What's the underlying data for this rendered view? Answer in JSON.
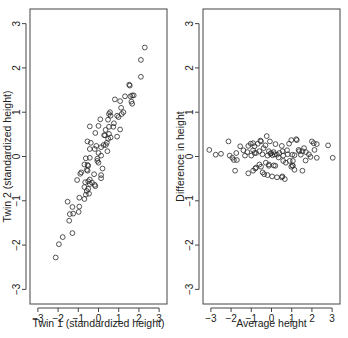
{
  "chart_data": [
    {
      "type": "scatter",
      "title": "",
      "xlabel": "Twin 1 (standardized height)",
      "ylabel": "Twin 2 (standardized height)",
      "xlim": [
        -3,
        3
      ],
      "ylim": [
        -3,
        3
      ],
      "xticks": [
        -3,
        -2,
        -1,
        0,
        1,
        2,
        3
      ],
      "yticks": [
        -3,
        -2,
        -1,
        0,
        1,
        2,
        3
      ],
      "grid": false,
      "legend": null,
      "marker": "open-circle",
      "points": [
        [
          2.29,
          2.46
        ],
        [
          2.1,
          2.18
        ],
        [
          2.1,
          1.8
        ],
        [
          1.52,
          1.62
        ],
        [
          1.55,
          1.6
        ],
        [
          1.31,
          1.36
        ],
        [
          1.74,
          1.38
        ],
        [
          1.58,
          1.36
        ],
        [
          1.67,
          1.38
        ],
        [
          1.07,
          1.25
        ],
        [
          1.63,
          1.24
        ],
        [
          1.67,
          1.19
        ],
        [
          0.81,
          1.29
        ],
        [
          1.12,
          1.1
        ],
        [
          1.23,
          1.0
        ],
        [
          1.15,
          0.96
        ],
        [
          0.57,
          1.0
        ],
        [
          0.6,
          0.92
        ],
        [
          0.92,
          0.92
        ],
        [
          0.99,
          0.89
        ],
        [
          0.52,
          0.96
        ],
        [
          0.09,
          0.84
        ],
        [
          0.47,
          0.83
        ],
        [
          0.76,
          0.75
        ],
        [
          0.0,
          0.69
        ],
        [
          0.52,
          0.67
        ],
        [
          0.73,
          0.67
        ],
        [
          0.35,
          0.6
        ],
        [
          1.07,
          0.61
        ],
        [
          0.28,
          0.48
        ],
        [
          0.92,
          0.45
        ],
        [
          -0.43,
          0.68
        ],
        [
          -0.16,
          0.53
        ],
        [
          0.32,
          0.48
        ],
        [
          0.52,
          0.51
        ],
        [
          0.6,
          0.43
        ],
        [
          0.48,
          0.4
        ],
        [
          -0.38,
          0.31
        ],
        [
          -0.55,
          0.34
        ],
        [
          0.41,
          0.31
        ],
        [
          0.36,
          0.26
        ],
        [
          0.25,
          0.26
        ],
        [
          -0.11,
          0.24
        ],
        [
          0.13,
          0.21
        ],
        [
          0.44,
          0.12
        ],
        [
          -0.19,
          0.17
        ],
        [
          -0.43,
          0.17
        ],
        [
          0.0,
          0.08
        ],
        [
          0.13,
          0.02
        ],
        [
          -0.43,
          -0.03
        ],
        [
          -0.63,
          -0.04
        ],
        [
          -0.06,
          -0.05
        ],
        [
          -0.06,
          -0.1
        ],
        [
          0.0,
          -0.14
        ],
        [
          -0.7,
          -0.18
        ],
        [
          -0.54,
          -0.19
        ],
        [
          -0.51,
          -0.21
        ],
        [
          0.2,
          -0.27
        ],
        [
          -0.58,
          -0.3
        ],
        [
          -0.54,
          -0.32
        ],
        [
          -0.85,
          -0.36
        ],
        [
          -0.9,
          -0.39
        ],
        [
          -0.22,
          -0.4
        ],
        [
          0.13,
          -0.42
        ],
        [
          -0.43,
          -0.52
        ],
        [
          0.13,
          -0.49
        ],
        [
          -0.32,
          -0.59
        ],
        [
          -0.16,
          -0.67
        ],
        [
          -1.06,
          -0.53
        ],
        [
          -0.66,
          -0.58
        ],
        [
          -0.51,
          -0.56
        ],
        [
          -0.43,
          -0.62
        ],
        [
          -0.19,
          -0.64
        ],
        [
          -0.7,
          -0.69
        ],
        [
          -0.51,
          -0.73
        ],
        [
          -0.58,
          -0.78
        ],
        [
          -0.47,
          -0.84
        ],
        [
          -0.63,
          -0.86
        ],
        [
          -0.95,
          -0.93
        ],
        [
          -0.7,
          -0.96
        ],
        [
          -1.53,
          -1.02
        ],
        [
          -1.29,
          -1.14
        ],
        [
          -0.95,
          -1.13
        ],
        [
          -0.98,
          -1.25
        ],
        [
          -1.25,
          -1.29
        ],
        [
          -1.42,
          -1.3
        ],
        [
          -1.45,
          -1.45
        ],
        [
          -1.29,
          -1.73
        ],
        [
          -1.77,
          -1.82
        ],
        [
          -1.96,
          -1.98
        ],
        [
          -2.12,
          -2.28
        ]
      ]
    },
    {
      "type": "scatter",
      "title": "",
      "xlabel": "Average height",
      "ylabel": "Difference in height",
      "xlim": [
        -3,
        3
      ],
      "ylim": [
        -3,
        3
      ],
      "xticks": [
        -3,
        -2,
        -1,
        0,
        1,
        2,
        3
      ],
      "yticks": [
        -3,
        -2,
        -1,
        0,
        1,
        2,
        3
      ],
      "grid": false,
      "legend": null,
      "marker": "open-circle",
      "points": [
        [
          -3.08,
          0.15
        ],
        [
          -2.76,
          0.04
        ],
        [
          -2.5,
          0.06
        ],
        [
          -2.13,
          0.34
        ],
        [
          -2.07,
          0.02
        ],
        [
          -1.94,
          -0.03
        ],
        [
          -1.86,
          -0.08
        ],
        [
          -1.74,
          0.08
        ],
        [
          -1.71,
          -0.08
        ],
        [
          -1.8,
          -0.32
        ],
        [
          -1.55,
          0.23
        ],
        [
          -1.39,
          0.14
        ],
        [
          -1.31,
          0.02
        ],
        [
          -1.2,
          0.1
        ],
        [
          -1.15,
          0.24
        ],
        [
          -1.03,
          0.29
        ],
        [
          -0.91,
          0.3
        ],
        [
          -1.0,
          0.02
        ],
        [
          -0.84,
          0.08
        ],
        [
          -1.15,
          -0.38
        ],
        [
          -0.91,
          -0.32
        ],
        [
          -0.8,
          -0.27
        ],
        [
          -0.76,
          -0.25
        ],
        [
          -0.55,
          0.36
        ],
        [
          -0.24,
          0.46
        ],
        [
          -0.08,
          0.34
        ],
        [
          -0.52,
          0.34
        ],
        [
          -0.68,
          0.29
        ],
        [
          -0.84,
          0.23
        ],
        [
          -0.39,
          0.19
        ],
        [
          -0.3,
          0.25
        ],
        [
          -0.91,
          0.14
        ],
        [
          -0.76,
          0.08
        ],
        [
          -0.6,
          0.12
        ],
        [
          -0.45,
          0.05
        ],
        [
          -0.2,
          0.02
        ],
        [
          -0.13,
          0.12
        ],
        [
          -0.05,
          0.06
        ],
        [
          -0.02,
          0.08
        ],
        [
          0.05,
          0.03
        ],
        [
          0.11,
          0.1
        ],
        [
          0.15,
          0.05
        ],
        [
          0.2,
          0.28
        ],
        [
          0.27,
          0.04
        ],
        [
          0.35,
          -0.02
        ],
        [
          0.39,
          0.08
        ],
        [
          0.55,
          0.12
        ],
        [
          0.58,
          0.02
        ],
        [
          0.51,
          0.24
        ],
        [
          0.8,
          0.05
        ],
        [
          0.77,
          0.14
        ],
        [
          0.87,
          0.29
        ],
        [
          0.98,
          0.37
        ],
        [
          1.22,
          0.39
        ],
        [
          1.25,
          0.37
        ],
        [
          1.03,
          0.04
        ],
        [
          1.14,
          0.03
        ],
        [
          1.34,
          0.15
        ],
        [
          1.37,
          0.12
        ],
        [
          1.53,
          0.12
        ],
        [
          1.45,
          0.04
        ],
        [
          1.61,
          0.19
        ],
        [
          1.7,
          0.1
        ],
        [
          1.85,
          0.05
        ],
        [
          2.0,
          0.34
        ],
        [
          2.09,
          0.3
        ],
        [
          2.24,
          0.28
        ],
        [
          2.13,
          0.15
        ],
        [
          2.8,
          0.25
        ],
        [
          1.93,
          -0.01
        ],
        [
          2.24,
          -0.03
        ],
        [
          3.03,
          -0.03
        ],
        [
          1.69,
          -0.09
        ],
        [
          0.58,
          -0.1
        ],
        [
          0.71,
          -0.14
        ],
        [
          0.9,
          -0.1
        ],
        [
          1.06,
          -0.1
        ],
        [
          1.03,
          -0.2
        ],
        [
          1.06,
          -0.21
        ],
        [
          0.98,
          -0.23
        ],
        [
          1.14,
          -0.3
        ],
        [
          1.53,
          -0.32
        ],
        [
          -0.6,
          -0.18
        ],
        [
          -0.52,
          -0.23
        ],
        [
          -0.28,
          -0.14
        ],
        [
          -0.13,
          -0.18
        ],
        [
          -0.13,
          -0.21
        ],
        [
          0.11,
          -0.2
        ],
        [
          0.19,
          -0.21
        ],
        [
          -0.44,
          -0.36
        ],
        [
          -0.36,
          -0.4
        ],
        [
          -0.2,
          -0.42
        ],
        [
          0.03,
          -0.45
        ],
        [
          0.27,
          -0.47
        ],
        [
          0.51,
          -0.47
        ],
        [
          0.54,
          -0.45
        ],
        [
          0.66,
          -0.51
        ]
      ]
    }
  ]
}
